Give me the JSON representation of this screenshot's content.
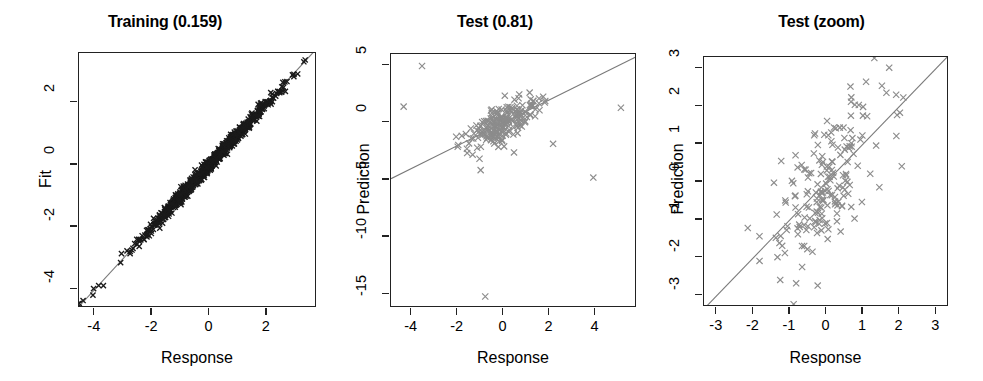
{
  "figure": {
    "width": 983,
    "height": 381,
    "background": "#ffffff",
    "marker_glyph": "x",
    "line_color": "#7a7a7a",
    "axis_color": "#222222"
  },
  "chart_data": [
    {
      "type": "scatter",
      "title": "Training (0.159)",
      "xlabel": "Response",
      "ylabel": "Fit",
      "xlim": [
        -4.55,
        3.75
      ],
      "ylim": [
        -4.6,
        3.6
      ],
      "xticks": [
        -4,
        -2,
        0,
        2
      ],
      "xticklabels": [
        "-4",
        "-2",
        "0",
        "2"
      ],
      "yticks": [
        -4,
        -2,
        0,
        2
      ],
      "yticklabels": [
        "-4",
        "-2",
        "0",
        "2"
      ],
      "grid": false,
      "legend": "none",
      "marker_color": "#1a1a1a",
      "point_count": 900,
      "noise_sd": 0.159,
      "reference_line": {
        "intercept": 0,
        "slope": 1,
        "color": "#7a7a7a"
      },
      "note": "dense point cloud tightly hugging the y = x identity line; residual sd 0.159"
    },
    {
      "type": "scatter",
      "title": "Test (0.81)",
      "xlabel": "Response",
      "ylabel": "Prediction",
      "xlim": [
        -4.9,
        5.8
      ],
      "ylim": [
        -16.2,
        6.0
      ],
      "xticks": [
        -4,
        -2,
        0,
        2,
        4
      ],
      "xticklabels": [
        "-4",
        "-2",
        "0",
        "2",
        "4"
      ],
      "yticks": [
        -15,
        -10,
        -5,
        0,
        5
      ],
      "yticklabels": [
        "-15",
        "-10",
        "-5",
        "0",
        "5"
      ],
      "grid": false,
      "legend": "none",
      "marker_color": "#8c8c8c",
      "point_count": 200,
      "noise_sd": 0.81,
      "reference_line": {
        "intercept": 0,
        "slope": 1,
        "color": "#7a7a7a"
      },
      "outliers": [
        {
          "x": -3.55,
          "y": 4.95
        },
        {
          "x": -4.35,
          "y": 1.4
        },
        {
          "x": 5.1,
          "y": 1.3
        },
        {
          "x": 2.15,
          "y": -1.85
        },
        {
          "x": 3.9,
          "y": -4.8
        },
        {
          "x": -0.8,
          "y": -15.2
        },
        {
          "x": -1.0,
          "y": -4.15
        },
        {
          "x": 0.45,
          "y": -2.6
        },
        {
          "x": -1.35,
          "y": -2.8
        },
        {
          "x": -1.05,
          "y": -3.15
        }
      ],
      "note": "central cluster near origin with several extreme outliers; one point far below at about (-0.8, -15.2)"
    },
    {
      "type": "scatter",
      "title": "Test (zoom)",
      "xlabel": "Response",
      "ylabel": "Prediction",
      "xlim": [
        -3.35,
        3.35
      ],
      "ylim": [
        -3.3,
        3.3
      ],
      "xticks": [
        -3,
        -2,
        -1,
        0,
        1,
        2,
        3
      ],
      "xticklabels": [
        "-3",
        "-2",
        "-1",
        "0",
        "1",
        "2",
        "3"
      ],
      "yticks": [
        -3,
        -2,
        -1,
        0,
        1,
        2,
        3
      ],
      "yticklabels": [
        "-3",
        "-2",
        "-1",
        "0",
        "1",
        "2",
        "3"
      ],
      "grid": false,
      "legend": "none",
      "marker_color": "#8c8c8c",
      "point_count": 185,
      "noise_sd": 0.81,
      "reference_line": {
        "intercept": 0,
        "slope": 1,
        "color": "#7a7a7a"
      },
      "note": "zoomed view of the Test panel spanning -3 to 3 on both axes; positive correlation scatter around the identity line"
    }
  ],
  "panels": [
    {
      "id": "training",
      "left": 0,
      "width": 330,
      "box": {
        "left": 78,
        "top": 52,
        "width": 238,
        "height": 255
      },
      "ylabel_left": 26,
      "ylabel_center": 180
    },
    {
      "id": "test",
      "left": 330,
      "width": 330,
      "box": {
        "left": 60,
        "top": 53,
        "width": 246,
        "height": 254
      },
      "ylabel_left": 14,
      "ylabel_center": 180
    },
    {
      "id": "test-zoom",
      "left": 660,
      "width": 323,
      "box": {
        "left": 43,
        "top": 56,
        "width": 245,
        "height": 250
      },
      "ylabel_left": -2,
      "ylabel_center": 180
    }
  ]
}
